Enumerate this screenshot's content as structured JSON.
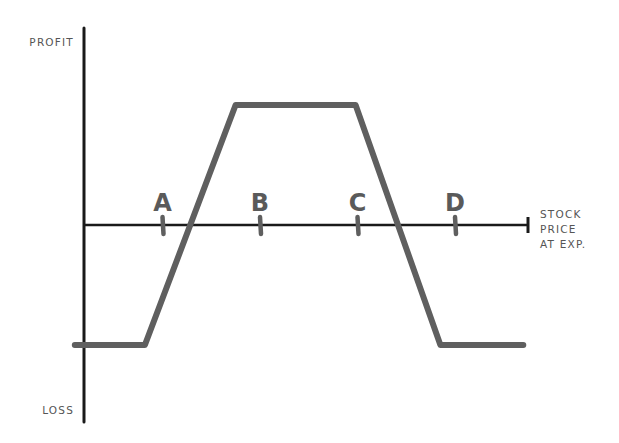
{
  "chart_data": {
    "type": "line",
    "title": "",
    "xlabel_lines": [
      "STOCK",
      "PRICE",
      "AT EXP."
    ],
    "ylabel_top": "PROFIT",
    "ylabel_bottom": "LOSS",
    "strike_labels": [
      "A",
      "B",
      "C",
      "D"
    ],
    "strikes": {
      "A": 1,
      "B": 2,
      "C": 3,
      "D": 4
    },
    "x_range": [
      0,
      5
    ],
    "y_range": [
      -1.6,
      2.0
    ],
    "payoff_points": [
      {
        "x": 0.1,
        "y": -1
      },
      {
        "x": 0.82,
        "y": -1
      },
      {
        "x": 1.75,
        "y": 1
      },
      {
        "x": 2.98,
        "y": 1
      },
      {
        "x": 3.85,
        "y": -1
      },
      {
        "x": 4.7,
        "y": -1
      }
    ],
    "colors": {
      "axis": "#1a1a1a",
      "payoff_line": "#5f5f5f",
      "labels": "#555555"
    }
  }
}
